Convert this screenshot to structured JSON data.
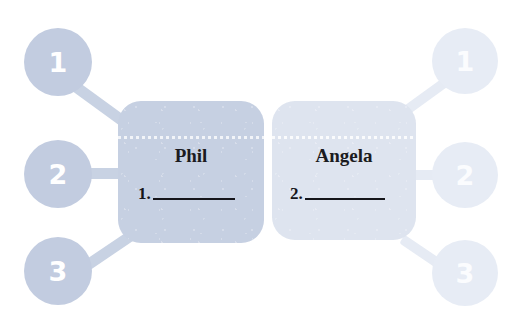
{
  "canvas": {
    "width": 524,
    "height": 328,
    "background": "#ffffff"
  },
  "theme": {
    "node_color": "#c2cce0",
    "node_color_faded": "#e7ecf5",
    "connector_color": "#c8d2e3",
    "connector_color_faded": "#e6ebf4",
    "card_primary_color": "#c6d0e2",
    "card_secondary_color": "#dee4ef",
    "text_color": "#15151a",
    "node_text_color": "#ffffff"
  },
  "left_group": {
    "name": "Phil",
    "nodes": [
      {
        "label": "1"
      },
      {
        "label": "2"
      },
      {
        "label": "3"
      }
    ],
    "card": {
      "name": "Phil",
      "entry_number": "1.",
      "entry_value": ""
    }
  },
  "right_group": {
    "name": "Angela",
    "nodes": [
      {
        "label": "1"
      },
      {
        "label": "2"
      },
      {
        "label": "3"
      }
    ],
    "card": {
      "name": "Angela",
      "entry_number": "2.",
      "entry_value": ""
    }
  }
}
